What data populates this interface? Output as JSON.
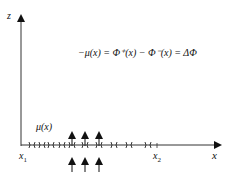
{
  "diagram": {
    "equation": "−μ(x) = Φ⁺(x) −  Φ⁻(x) = ΔΦ",
    "axes": {
      "vertical_label": "z",
      "horizontal_label": "x"
    },
    "points": {
      "x1": "x",
      "x1_sub": "1",
      "x2": "x",
      "x2_sub": "2"
    },
    "distribution_label": "μ(x)",
    "markers": {
      "count": 11,
      "glyph": ")("
    },
    "flux_arrows": {
      "count": 3,
      "direction": "up"
    },
    "colors": {
      "ink": "#111111",
      "background": "#ffffff"
    }
  }
}
